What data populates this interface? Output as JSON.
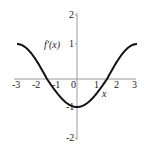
{
  "chart_data": {
    "type": "line",
    "title": "",
    "xlabel": "x",
    "ylabel": "f'(x)",
    "xlim": [
      -3,
      3
    ],
    "ylim": [
      -2,
      2
    ],
    "x_ticks": [
      "-3",
      "-2",
      "-1",
      "0",
      "1",
      "2",
      "3"
    ],
    "y_ticks": [
      "2",
      "1",
      "-1",
      "-2"
    ],
    "grid": false,
    "series": [
      {
        "name": "f'(x)",
        "x": [
          -3,
          -2.5,
          -2,
          -1.5,
          -1,
          -0.5,
          0,
          0.5,
          1,
          1.5,
          2,
          2.5,
          3
        ],
        "values": [
          1,
          0.87,
          0.5,
          0,
          -0.5,
          -0.87,
          -1,
          -0.87,
          -0.5,
          0,
          0.5,
          0.87,
          1
        ]
      }
    ]
  },
  "labels": {
    "x_axis": "x",
    "y_axis": "f'(x)",
    "x_ticks": [
      "-3",
      "-2",
      "-1",
      "0",
      "1",
      "2",
      "3"
    ],
    "y_ticks": [
      "2",
      "1",
      "-1",
      "-2"
    ]
  },
  "colors": {
    "curve": "#111111",
    "axis": "#999999"
  }
}
